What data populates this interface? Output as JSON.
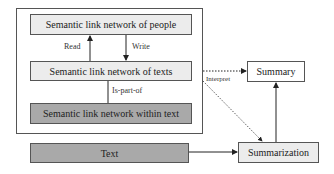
{
  "diagram": {
    "nodes": {
      "people": "Semantic link network of people",
      "texts": "Semantic link network of texts",
      "within_text": "Semantic link network within text",
      "text": "Text",
      "summary": "Summary",
      "summarization": "Summarization"
    },
    "edges": {
      "read": "Read",
      "write": "Write",
      "is_part_of": "Is-part-of",
      "interpret": "Interpret"
    },
    "colors": {
      "light_fill": "#ececec",
      "dark_fill": "#a9a9a9",
      "border": "#555555"
    }
  }
}
